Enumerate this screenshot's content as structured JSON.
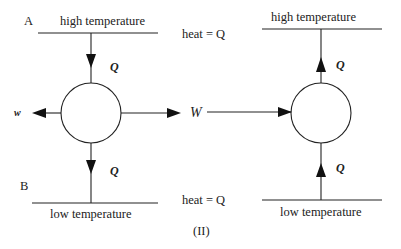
{
  "figure_label": "(II)",
  "left": {
    "top_reservoir": {
      "letter": "A",
      "label": "high temperature"
    },
    "bottom_reservoir": {
      "letter": "B",
      "label": "low temperature"
    },
    "heat_in": "Q",
    "heat_out": "Q",
    "work_out_small": "w",
    "work_out": "W"
  },
  "middle": {
    "heat_top": "heat = Q",
    "heat_bottom": "heat = Q"
  },
  "right": {
    "top_reservoir": {
      "label": "high temperature"
    },
    "bottom_reservoir": {
      "label": "low temperature"
    },
    "heat_up_top": "Q",
    "heat_up_bottom": "Q"
  },
  "colors": {
    "line": "#222222",
    "background": "#ffffff"
  }
}
